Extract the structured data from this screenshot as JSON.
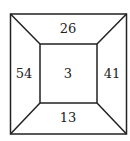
{
  "diagram": {
    "top": "26",
    "left": "54",
    "center": "3",
    "right": "41",
    "bottom": "13"
  }
}
